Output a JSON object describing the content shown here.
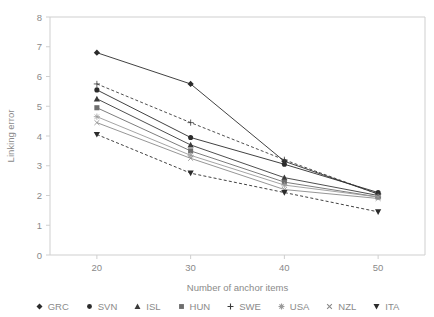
{
  "page": {
    "cutoff_text": "· · · · · · · · · · · · · ·"
  },
  "chart_data": {
    "type": "line",
    "title": "",
    "subtitle": "",
    "xlabel": "Number of anchor items",
    "ylabel": "Linking error",
    "x": [
      20,
      30,
      40,
      50
    ],
    "xtick_labels": [
      "20",
      "30",
      "40",
      "50"
    ],
    "ytick_labels": [
      "0",
      "1",
      "2",
      "3",
      "4",
      "5",
      "6",
      "7",
      "8"
    ],
    "xlim": [
      15,
      55
    ],
    "ylim": [
      0,
      8
    ],
    "grid": false,
    "legend_position": "bottom",
    "series": [
      {
        "name": "GRC",
        "marker": "diamond",
        "dashed": false,
        "color": "#2b2b2b",
        "values": [
          6.8,
          5.75,
          3.15,
          2.05
        ]
      },
      {
        "name": "SVN",
        "marker": "circle",
        "dashed": false,
        "color": "#2b2b2b",
        "values": [
          5.55,
          3.95,
          3.05,
          2.1
        ]
      },
      {
        "name": "ISL",
        "marker": "triangle-up",
        "dashed": false,
        "color": "#3a3a3a",
        "values": [
          5.25,
          3.7,
          2.6,
          2.0
        ]
      },
      {
        "name": "HUN",
        "marker": "square",
        "dashed": false,
        "color": "#6e6e6e",
        "values": [
          4.95,
          3.5,
          2.45,
          1.95
        ]
      },
      {
        "name": "SWE",
        "marker": "plus",
        "dashed": true,
        "color": "#3a3a3a",
        "values": [
          5.75,
          4.45,
          3.2,
          2.05
        ]
      },
      {
        "name": "USA",
        "marker": "asterisk",
        "dashed": false,
        "color": "#9a9a9a",
        "values": [
          4.65,
          3.35,
          2.35,
          1.95
        ]
      },
      {
        "name": "NZL",
        "marker": "cross",
        "dashed": false,
        "color": "#8a8a8a",
        "values": [
          4.45,
          3.25,
          2.2,
          1.9
        ]
      },
      {
        "name": "ITA",
        "marker": "triangle-down",
        "dashed": true,
        "color": "#2b2b2b",
        "values": [
          4.05,
          2.75,
          2.1,
          1.45
        ]
      }
    ]
  },
  "legend": {
    "items": [
      {
        "label": "GRC",
        "marker": "diamond"
      },
      {
        "label": "SVN",
        "marker": "circle"
      },
      {
        "label": "ISL",
        "marker": "triangle-up"
      },
      {
        "label": "HUN",
        "marker": "square"
      },
      {
        "label": "SWE",
        "marker": "plus"
      },
      {
        "label": "USA",
        "marker": "asterisk"
      },
      {
        "label": "NZL",
        "marker": "cross"
      },
      {
        "label": "ITA",
        "marker": "triangle-down"
      }
    ]
  }
}
